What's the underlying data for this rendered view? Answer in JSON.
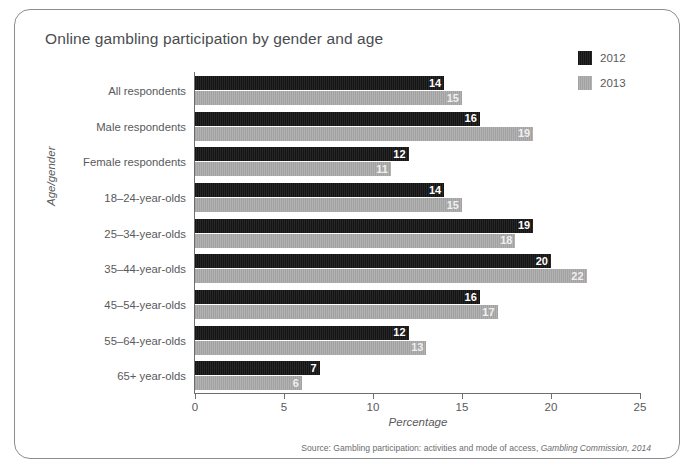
{
  "chart_data": {
    "type": "bar",
    "orientation": "horizontal",
    "title": "Online gambling participation by gender and age",
    "xlabel": "Percentage",
    "ylabel": "Age/gender",
    "xlim": [
      0,
      25
    ],
    "xticks": [
      0,
      5,
      10,
      15,
      20,
      25
    ],
    "grid": false,
    "legend_position": "top-right",
    "categories": [
      "All respondents",
      "Male respondents",
      "Female respondents",
      "18–24-year-olds",
      "25–34-year-olds",
      "35–44-year-olds",
      "45–54-year-olds",
      "55–64-year-olds",
      "65+ year-olds"
    ],
    "series": [
      {
        "name": "2012",
        "color": "#1c1c1c",
        "values": [
          14,
          16,
          12,
          14,
          19,
          20,
          16,
          12,
          7
        ]
      },
      {
        "name": "2013",
        "color": "#a9a9a9",
        "values": [
          15,
          19,
          11,
          15,
          18,
          22,
          17,
          13,
          6
        ]
      }
    ],
    "source_prefix": "Source: Gambling participation: activities and mode of access, ",
    "source_italic": "Gambling Commission, 2014"
  }
}
